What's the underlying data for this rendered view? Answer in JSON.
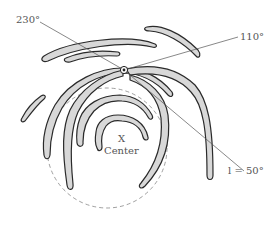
{
  "diagram": {
    "type": "spiral galaxy arms schematic with galactic longitude sight lines",
    "labels": {
      "l230": "230°",
      "l110": "110°",
      "l50": "l = 50°",
      "center_mark": "X",
      "center_text": "Center"
    },
    "sight_lines": [
      {
        "longitude": "230°"
      },
      {
        "longitude": "110°"
      },
      {
        "longitude": "l = 50°"
      }
    ],
    "observer_marker": "sun-position",
    "colors": {
      "arm_fill": "#d8d8d8",
      "arm_stroke": "#2a2a2a",
      "line": "#555555",
      "circle": "#777777",
      "text": "#555555"
    }
  }
}
